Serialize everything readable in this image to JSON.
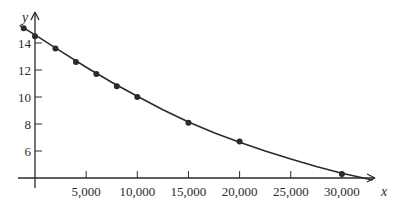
{
  "chart_data": {
    "type": "scatter",
    "title": "",
    "xlabel": "x",
    "ylabel": "y",
    "xlim": [
      -1500,
      34000
    ],
    "ylim": [
      4,
      15.5
    ],
    "grid": false,
    "legend": null,
    "x_ticks": [
      5000,
      10000,
      15000,
      20000,
      25000,
      30000
    ],
    "x_tick_labels": [
      "5,000",
      "10,000",
      "15,000",
      "20,000",
      "25,000",
      "30,000"
    ],
    "y_ticks": [
      6,
      8,
      10,
      12,
      14
    ],
    "y_tick_labels": [
      "6",
      "8",
      "10",
      "12",
      "14"
    ],
    "series": [
      {
        "name": "data points",
        "kind": "scatter",
        "x": [
          -1100,
          0,
          2000,
          4000,
          6000,
          8000,
          10000,
          15000,
          20000,
          30000
        ],
        "y": [
          15.1,
          14.5,
          13.6,
          12.6,
          11.7,
          10.8,
          10.0,
          8.1,
          6.7,
          4.3
        ]
      },
      {
        "name": "fitted curve",
        "kind": "line",
        "x": [
          -1500,
          0,
          2500,
          5000,
          7500,
          10000,
          12500,
          15000,
          17500,
          20000,
          22500,
          25000,
          27500,
          30000,
          33000
        ],
        "y": [
          15.3,
          14.6,
          13.4,
          12.2,
          11.1,
          10.05,
          9.05,
          8.15,
          7.35,
          6.65,
          6.0,
          5.4,
          4.85,
          4.35,
          3.85
        ]
      }
    ],
    "colors": {
      "ink": "#2b2b2b",
      "background": "#ffffff"
    }
  }
}
